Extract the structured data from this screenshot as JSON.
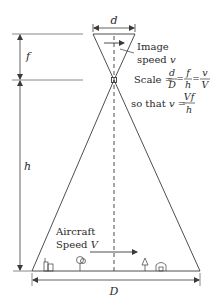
{
  "diagram": {
    "type": "aerial-camera-geometry",
    "labels": {
      "d": "d",
      "f": "f",
      "h": "h",
      "D": "D",
      "image_speed_line1": "Image",
      "image_speed_line2": "speed ",
      "image_speed_var": "v",
      "scale_word": "Scale = ",
      "frac1_num": "d",
      "frac1_den": "D",
      "frac2_num": "f",
      "frac2_den": "h",
      "frac3_num": "v",
      "frac3_den": "V",
      "eq": "=",
      "so_that": "so that ",
      "so_that_var": "v",
      "so_that_eq": " = ",
      "vf_num": "Vf",
      "vf_den": "h",
      "aircraft_line1": "Aircraft",
      "aircraft_line2": "Speed ",
      "aircraft_var": "V"
    },
    "ground_objects": [
      "building-icon",
      "tree-icon",
      "small-tree-icon",
      "house-icon"
    ],
    "colors": {
      "line": "#3a3a3a",
      "text": "#2a2a2a"
    }
  }
}
